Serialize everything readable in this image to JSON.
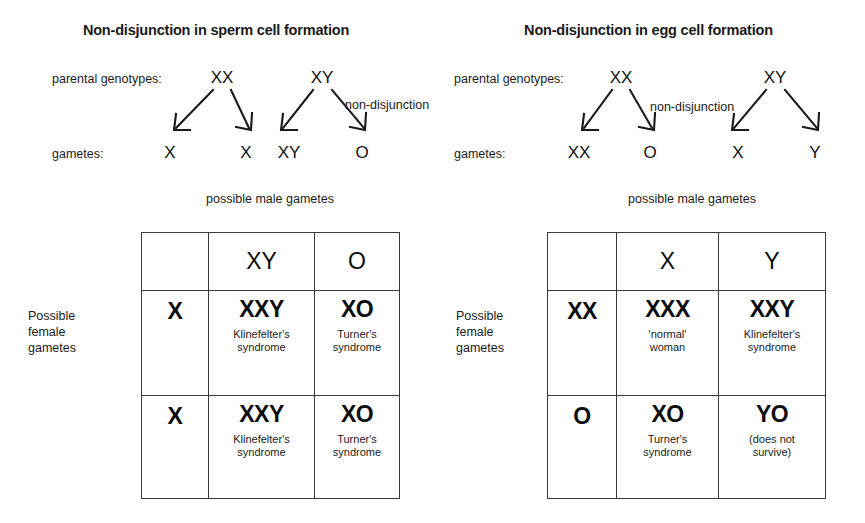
{
  "panels": [
    {
      "id": "sperm",
      "title": "Non-disjunction in sperm cell formation",
      "cross": {
        "parental_label": "parental genotypes:",
        "gametes_label": "gametes:",
        "nondisjunction_label": "non-disjunction",
        "parents": [
          {
            "genotype": "XX",
            "x": 222
          },
          {
            "genotype": "XY",
            "x": 322
          }
        ],
        "gametes": [
          {
            "value": "X",
            "x": 170
          },
          {
            "value": "X",
            "x": 246
          },
          {
            "value": "XY",
            "x": 289
          },
          {
            "value": "O",
            "x": 362
          }
        ]
      },
      "male_caption": "possible male gametes",
      "female_label_lines": [
        "Possible",
        "female",
        "gametes"
      ],
      "table": {
        "column_headers": [
          "XY",
          "O"
        ],
        "row_headers": [
          "X",
          "X"
        ],
        "cells": [
          [
            {
              "genotype": "XXY",
              "note": [
                "Klinefelter's",
                "syndrome"
              ]
            },
            {
              "genotype": "XO",
              "note": [
                "Turner's",
                "syndrome"
              ]
            }
          ],
          [
            {
              "genotype": "XXY",
              "note": [
                "Klinefelter's",
                "syndrome"
              ]
            },
            {
              "genotype": "XO",
              "note": [
                "Turner's",
                "syndrome"
              ]
            }
          ]
        ]
      }
    },
    {
      "id": "egg",
      "title": "Non-disjunction in egg cell formation",
      "cross": {
        "parental_label": "parental genotypes:",
        "gametes_label": "gametes:",
        "nondisjunction_label": "non-disjunction",
        "parents": [
          {
            "genotype": "XX",
            "x": 189
          },
          {
            "genotype": "XY",
            "x": 343
          }
        ],
        "gametes": [
          {
            "value": "XX",
            "x": 147
          },
          {
            "value": "O",
            "x": 218
          },
          {
            "value": "X",
            "x": 306
          },
          {
            "value": "Y",
            "x": 383
          }
        ]
      },
      "male_caption": "possible male gametes",
      "female_label_lines": [
        "Possible",
        "female",
        "gametes"
      ],
      "table": {
        "column_headers": [
          "X",
          "Y"
        ],
        "row_headers": [
          "XX",
          "O"
        ],
        "cells": [
          [
            {
              "genotype": "XXX",
              "note": [
                "'normal'",
                "woman"
              ]
            },
            {
              "genotype": "XXY",
              "note": [
                "Klinefelter's",
                "syndrome"
              ]
            }
          ],
          [
            {
              "genotype": "XO",
              "note": [
                "Turner's",
                "syndrome"
              ]
            },
            {
              "genotype": "YO",
              "note": [
                "(does not",
                "survive)"
              ]
            }
          ]
        ]
      }
    }
  ],
  "colors": {
    "background": "#ffffff",
    "ink": "#111111",
    "grid_line": "#3a3a3a"
  }
}
